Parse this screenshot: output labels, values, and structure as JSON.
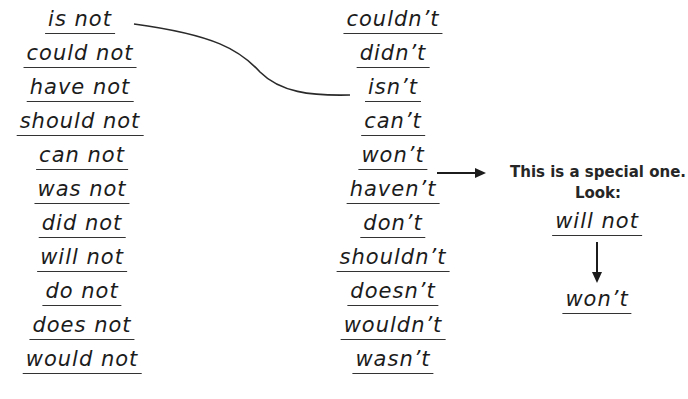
{
  "left_column": [
    "is not",
    "could not",
    "have not",
    "should not",
    "can not",
    "was not",
    "did not",
    "will not",
    "do not",
    "does not",
    "would not"
  ],
  "right_column": [
    "couldn’t",
    "didn’t",
    "isn’t",
    "can’t",
    "won’t",
    "haven’t",
    "don’t",
    "shouldn’t",
    "doesn’t",
    "wouldn’t",
    "wasn’t"
  ],
  "connections": [
    {
      "from": "is not",
      "to": "isn’t",
      "shape": "curve"
    }
  ],
  "special_note": {
    "line1": "This is a special one.",
    "line2": "Look:",
    "from_word": "will not",
    "to_word": "won’t",
    "arrow_source": "won’t"
  },
  "icons": {
    "right_arrow": "right-arrow-icon",
    "down_arrow": "down-arrow-icon"
  }
}
